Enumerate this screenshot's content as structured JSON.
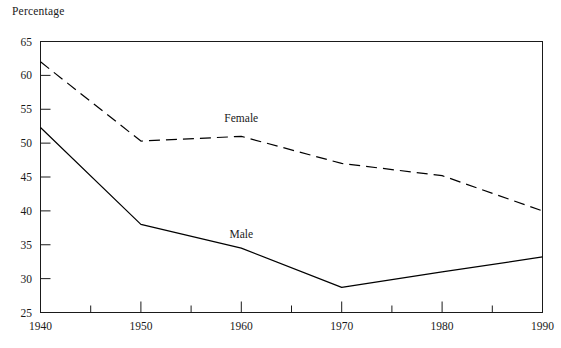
{
  "chart_data": {
    "type": "line",
    "title": "",
    "ylabel": "Percentage",
    "xlabel": "",
    "x": [
      1940,
      1950,
      1960,
      1970,
      1980,
      1990
    ],
    "xlim": [
      1940,
      1990
    ],
    "ylim": [
      25,
      65
    ],
    "y_ticks": [
      25,
      30,
      35,
      40,
      45,
      50,
      55,
      60,
      65
    ],
    "y_tick_labels": [
      "25",
      "30",
      "35",
      "40",
      "45",
      "50",
      "55",
      "60",
      "65"
    ],
    "x_ticks": [
      1940,
      1950,
      1960,
      1970,
      1980,
      1990
    ],
    "x_tick_labels": [
      "1940",
      "1950",
      "1960",
      "1970",
      "1980",
      "1990"
    ],
    "x_minor_ticks": [
      1945,
      1955,
      1965,
      1975,
      1985
    ],
    "grid": false,
    "legend_position": "inline-labels",
    "series": [
      {
        "name": "Female",
        "style": "dashed",
        "color": "#000000",
        "values": [
          62.0,
          50.3,
          51.0,
          47.0,
          45.2,
          40.0
        ],
        "label_x": 1960,
        "label_y": 53.5
      },
      {
        "name": "Male",
        "style": "solid",
        "color": "#000000",
        "values": [
          52.3,
          38.0,
          34.5,
          28.7,
          31.0,
          33.2
        ],
        "label_x": 1960,
        "label_y": 36.5
      }
    ]
  }
}
